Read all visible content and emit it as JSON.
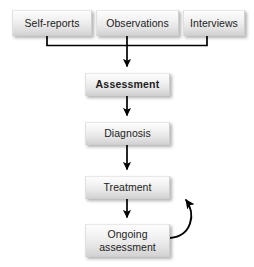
{
  "diagram": {
    "type": "flowchart",
    "background_color": "#ffffff",
    "node_fill_top": "#fdfdfd",
    "node_fill_bottom": "#d2d2d2",
    "edge_color": "#000000",
    "nodes": {
      "self_reports": "Self-reports",
      "observations": "Observations",
      "interviews": "Interviews",
      "assessment": "Assessment",
      "diagnosis": "Diagnosis",
      "treatment": "Treatment",
      "ongoing_assessment": "Ongoing\nassessment"
    },
    "edges": [
      {
        "from": "self-reports",
        "to": "assessment",
        "style": "bracket-merge"
      },
      {
        "from": "observations",
        "to": "assessment",
        "style": "bracket-merge"
      },
      {
        "from": "interviews",
        "to": "assessment",
        "style": "bracket-merge"
      },
      {
        "from": "assessment",
        "to": "diagnosis",
        "style": "straight-arrow"
      },
      {
        "from": "diagnosis",
        "to": "treatment",
        "style": "straight-arrow"
      },
      {
        "from": "treatment",
        "to": "ongoing-assessment",
        "style": "straight-arrow"
      },
      {
        "from": "ongoing-assessment",
        "to": "treatment",
        "style": "curved-feedback-arrow"
      }
    ]
  }
}
